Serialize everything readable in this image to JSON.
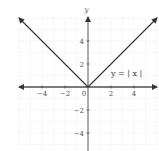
{
  "chart_data": {
    "type": "line",
    "title": "",
    "xlabel": "",
    "ylabel": "y",
    "xlim": [
      -6,
      6
    ],
    "ylim": [
      -5.5,
      6
    ],
    "grid": true,
    "x_ticks": [
      -4,
      -2,
      0,
      2,
      4
    ],
    "y_ticks": [
      4,
      2,
      -2,
      -4
    ],
    "x_tick_labels": [
      "−4",
      "−2",
      "0",
      "2",
      "4"
    ],
    "y_tick_labels": [
      "4",
      "2",
      "−2",
      "−4"
    ],
    "series": [
      {
        "name": "y = |x|",
        "x": [
          -6,
          0,
          6
        ],
        "y": [
          6,
          0,
          6
        ],
        "arrows_at_ends": true,
        "color": "#333333"
      }
    ],
    "annotations": [
      {
        "text": "y = | x |",
        "x": 2,
        "y": 1.2
      }
    ]
  },
  "labels": {
    "y_axis": "y",
    "function": "y = | x |",
    "origin": "0"
  }
}
